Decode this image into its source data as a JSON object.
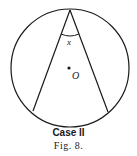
{
  "diagram": {
    "circle": {
      "cx": 70,
      "cy": 68,
      "r": 59
    },
    "vertex": {
      "x": 70,
      "y": 10
    },
    "chord_left_end": {
      "x": 33,
      "y": 111
    },
    "chord_right_end": {
      "x": 108,
      "y": 112
    },
    "center_label": "O",
    "angle_label": "x",
    "stroke_color": "#1a1a1a"
  },
  "caption": {
    "case": "Case II",
    "figure": "Fig. 8."
  }
}
